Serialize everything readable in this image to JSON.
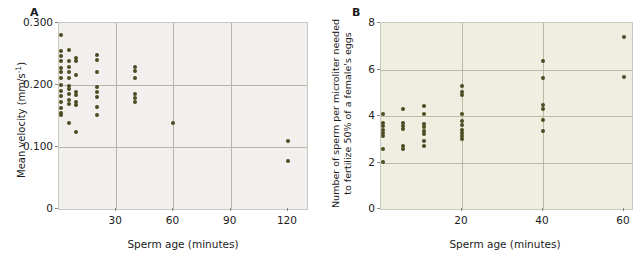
{
  "figure": {
    "panels": [
      {
        "letter": "A",
        "chart_data": {
          "type": "scatter",
          "title": "",
          "xlabel": "Sperm age (minutes)",
          "ylabel": "Mean velocity (mm/s⁻¹)",
          "ylabel_main": "Mean velocity (mm/s",
          "ylabel_exp": "-1",
          "ylabel_tail": ")",
          "xlim": [
            0,
            130
          ],
          "ylim": [
            0,
            0.3
          ],
          "xticks": [
            30,
            60,
            90,
            120
          ],
          "xticklabels": [
            "30",
            "60",
            "90",
            "120"
          ],
          "yticks": [
            0,
            0.1,
            0.2,
            0.3
          ],
          "yticklabels": [
            "0",
            "0.100",
            "0.200",
            "0.300"
          ],
          "grid": true,
          "grid_x": [
            30,
            60,
            90
          ],
          "grid_y": [
            0.1,
            0.2
          ],
          "legend": null,
          "marker_color": "#4c4c22",
          "plot_background": "#f1f0ee",
          "points": [
            {
              "x": 1,
              "y": 0.281
            },
            {
              "x": 1,
              "y": 0.255
            },
            {
              "x": 1,
              "y": 0.246
            },
            {
              "x": 1,
              "y": 0.238
            },
            {
              "x": 1,
              "y": 0.228
            },
            {
              "x": 1,
              "y": 0.221
            },
            {
              "x": 1,
              "y": 0.212
            },
            {
              "x": 1,
              "y": 0.2
            },
            {
              "x": 1,
              "y": 0.191
            },
            {
              "x": 1,
              "y": 0.183
            },
            {
              "x": 1,
              "y": 0.173
            },
            {
              "x": 1,
              "y": 0.163
            },
            {
              "x": 1,
              "y": 0.155
            },
            {
              "x": 1,
              "y": 0.151
            },
            {
              "x": 5,
              "y": 0.256
            },
            {
              "x": 5,
              "y": 0.238
            },
            {
              "x": 5,
              "y": 0.229
            },
            {
              "x": 5,
              "y": 0.221
            },
            {
              "x": 5,
              "y": 0.212
            },
            {
              "x": 5,
              "y": 0.198
            },
            {
              "x": 5,
              "y": 0.193
            },
            {
              "x": 5,
              "y": 0.185
            },
            {
              "x": 5,
              "y": 0.176
            },
            {
              "x": 5,
              "y": 0.17
            },
            {
              "x": 5,
              "y": 0.139
            },
            {
              "x": 9,
              "y": 0.243
            },
            {
              "x": 9,
              "y": 0.238
            },
            {
              "x": 9,
              "y": 0.216
            },
            {
              "x": 9,
              "y": 0.188
            },
            {
              "x": 9,
              "y": 0.184
            },
            {
              "x": 9,
              "y": 0.172
            },
            {
              "x": 9,
              "y": 0.168
            },
            {
              "x": 9,
              "y": 0.124
            },
            {
              "x": 20,
              "y": 0.248
            },
            {
              "x": 20,
              "y": 0.24
            },
            {
              "x": 20,
              "y": 0.221
            },
            {
              "x": 20,
              "y": 0.196
            },
            {
              "x": 20,
              "y": 0.189
            },
            {
              "x": 20,
              "y": 0.18
            },
            {
              "x": 20,
              "y": 0.165
            },
            {
              "x": 20,
              "y": 0.151
            },
            {
              "x": 40,
              "y": 0.229
            },
            {
              "x": 40,
              "y": 0.223
            },
            {
              "x": 40,
              "y": 0.211
            },
            {
              "x": 40,
              "y": 0.186
            },
            {
              "x": 40,
              "y": 0.179
            },
            {
              "x": 40,
              "y": 0.172
            },
            {
              "x": 60,
              "y": 0.139
            },
            {
              "x": 120,
              "y": 0.11
            },
            {
              "x": 120,
              "y": 0.077
            }
          ]
        }
      },
      {
        "letter": "B",
        "chart_data": {
          "type": "scatter",
          "title": "",
          "xlabel": "Sperm age (minutes)",
          "ylabel": "Number of sperm per microliter needed to fertilize 50% of a female's eggs",
          "ylabel_line1": "Number of sperm per microliter needed",
          "ylabel_line2": "to fertilize 50% of a female's eggs",
          "xlim": [
            0,
            62
          ],
          "ylim": [
            0,
            8
          ],
          "xticks": [
            20,
            40,
            60
          ],
          "xticklabels": [
            "20",
            "40",
            "60"
          ],
          "yticks": [
            0,
            2,
            4,
            6,
            8
          ],
          "yticklabels": [
            "0",
            "2",
            "4",
            "6",
            "8"
          ],
          "grid": true,
          "grid_x": [
            20,
            40
          ],
          "grid_y": [
            2,
            4,
            6
          ],
          "legend": null,
          "marker_color": "#4c4c22",
          "plot_background": "#eeeee1",
          "points": [
            {
              "x": 0.6,
              "y": 4.1
            },
            {
              "x": 0.6,
              "y": 3.68
            },
            {
              "x": 0.6,
              "y": 3.55
            },
            {
              "x": 0.6,
              "y": 3.4
            },
            {
              "x": 0.6,
              "y": 3.28
            },
            {
              "x": 0.6,
              "y": 3.15
            },
            {
              "x": 0.6,
              "y": 2.58
            },
            {
              "x": 0.6,
              "y": 2.02
            },
            {
              "x": 5.5,
              "y": 4.3
            },
            {
              "x": 5.5,
              "y": 3.72
            },
            {
              "x": 5.5,
              "y": 3.58
            },
            {
              "x": 5.5,
              "y": 3.44
            },
            {
              "x": 5.5,
              "y": 2.7
            },
            {
              "x": 5.5,
              "y": 2.57
            },
            {
              "x": 10.5,
              "y": 4.42
            },
            {
              "x": 10.5,
              "y": 4.08
            },
            {
              "x": 10.5,
              "y": 3.66
            },
            {
              "x": 10.5,
              "y": 3.52
            },
            {
              "x": 10.5,
              "y": 3.36
            },
            {
              "x": 10.5,
              "y": 3.22
            },
            {
              "x": 10.5,
              "y": 2.92
            },
            {
              "x": 10.5,
              "y": 2.72
            },
            {
              "x": 20,
              "y": 5.3
            },
            {
              "x": 20,
              "y": 5.05
            },
            {
              "x": 20,
              "y": 4.9
            },
            {
              "x": 20,
              "y": 4.08
            },
            {
              "x": 20,
              "y": 3.78
            },
            {
              "x": 20,
              "y": 3.62
            },
            {
              "x": 20,
              "y": 3.4
            },
            {
              "x": 20,
              "y": 3.28
            },
            {
              "x": 20,
              "y": 3.14
            },
            {
              "x": 20,
              "y": 3.0
            },
            {
              "x": 40,
              "y": 6.38
            },
            {
              "x": 40,
              "y": 5.65
            },
            {
              "x": 40,
              "y": 4.46
            },
            {
              "x": 40,
              "y": 4.3
            },
            {
              "x": 40,
              "y": 3.82
            },
            {
              "x": 40,
              "y": 3.36
            },
            {
              "x": 60,
              "y": 7.4
            },
            {
              "x": 60,
              "y": 5.68
            }
          ]
        }
      }
    ]
  }
}
